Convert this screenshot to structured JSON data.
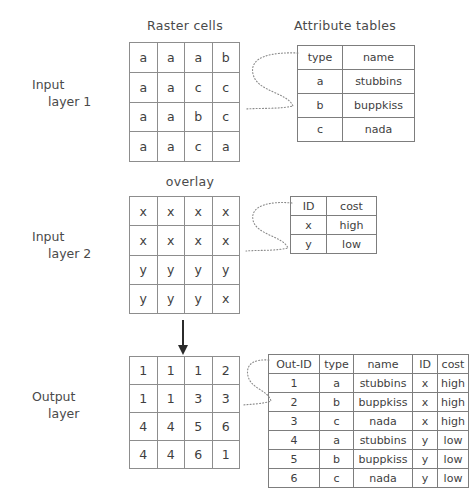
{
  "headings": {
    "raster_cells": "Raster cells",
    "attribute_tables": "Attribute tables",
    "overlay": "overlay"
  },
  "labels": {
    "input_layer_1_line1": "Input",
    "input_layer_1_line2": "layer 1",
    "input_layer_2_line1": "Input",
    "input_layer_2_line2": "layer 2",
    "output_layer_line1": "Output",
    "output_layer_line2": "layer"
  },
  "colors": {
    "grid_line": "#8d8d8d",
    "table_line": "#7d7d7d",
    "text": "#3e3e3e",
    "arrow": "#2b2b2b",
    "connector": "#8a8a8a",
    "background": "#ffffff"
  },
  "grids": {
    "input_layer_1": {
      "rows": 4,
      "cols": 4,
      "cells": [
        [
          "a",
          "a",
          "a",
          "b"
        ],
        [
          "a",
          "a",
          "c",
          "c"
        ],
        [
          "a",
          "a",
          "b",
          "c"
        ],
        [
          "a",
          "a",
          "c",
          "a"
        ]
      ]
    },
    "input_layer_2": {
      "rows": 4,
      "cols": 4,
      "cells": [
        [
          "x",
          "x",
          "x",
          "x"
        ],
        [
          "x",
          "x",
          "x",
          "x"
        ],
        [
          "y",
          "y",
          "y",
          "y"
        ],
        [
          "y",
          "y",
          "y",
          "x"
        ]
      ]
    },
    "output_layer": {
      "rows": 4,
      "cols": 4,
      "cells": [
        [
          "1",
          "1",
          "1",
          "2"
        ],
        [
          "1",
          "1",
          "3",
          "3"
        ],
        [
          "4",
          "4",
          "5",
          "6"
        ],
        [
          "4",
          "4",
          "6",
          "1"
        ]
      ]
    }
  },
  "tables": {
    "attribute_table_1": {
      "headers": [
        "type",
        "name"
      ],
      "rows": [
        [
          "a",
          "stubbins"
        ],
        [
          "b",
          "buppkiss"
        ],
        [
          "c",
          "nada"
        ]
      ]
    },
    "attribute_table_2": {
      "headers": [
        "ID",
        "cost"
      ],
      "rows": [
        [
          "x",
          "high"
        ],
        [
          "y",
          "low"
        ]
      ]
    },
    "output_table": {
      "headers": [
        "Out-ID",
        "type",
        "name",
        "ID",
        "cost"
      ],
      "rows": [
        [
          "1",
          "a",
          "stubbins",
          "x",
          "high"
        ],
        [
          "2",
          "b",
          "buppkiss",
          "x",
          "high"
        ],
        [
          "3",
          "c",
          "nada",
          "x",
          "high"
        ],
        [
          "4",
          "a",
          "stubbins",
          "y",
          "low"
        ],
        [
          "5",
          "b",
          "buppkiss",
          "y",
          "low"
        ],
        [
          "6",
          "c",
          "nada",
          "y",
          "low"
        ]
      ]
    }
  }
}
